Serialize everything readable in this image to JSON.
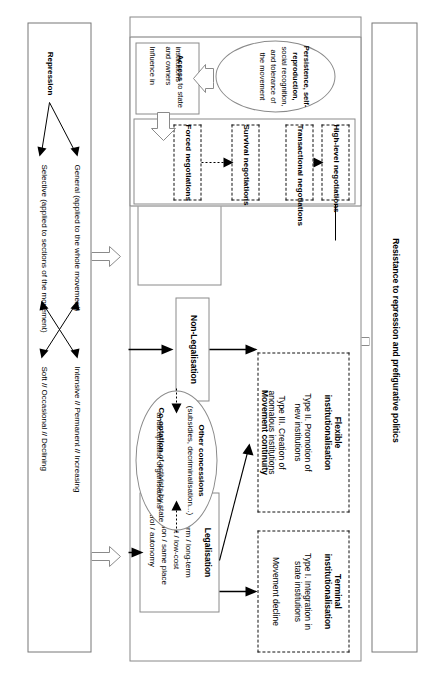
{
  "diagram": {
    "left_panel": {
      "name": "repression-panel",
      "root_label": "Repression",
      "branches": [
        {
          "label": "General (applied to the whole movement)",
          "intensity": "Intensive // Permanent // Increasing"
        },
        {
          "label": "Selective (applied to sections of the movement)",
          "intensity": "Soft // Occasional // Declining"
        }
      ]
    },
    "right_panel": {
      "name": "resistance-panel",
      "label": "Resistance to repression and prefigurative politics"
    },
    "center": {
      "outcomes": [
        {
          "name": "terminal-institutionalisation",
          "title": "Terminal\ninstitutionalisation",
          "lines": [
            "Type I. Integration in\nstate institutions",
            "Movement decline"
          ]
        },
        {
          "name": "flexible-institutionalisation",
          "title": "Flexible\ninstitutionalisation",
          "lines": [
            "Type II. Promotion of\nnew institutions",
            "Type III. Creation of\nanomalous institutions",
            "Movement continuity"
          ]
        }
      ],
      "legalisation": {
        "title": "Legalisation",
        "lines": [
          "Short-term / long-term",
          "High-cost / low-cost",
          "Relocation / same place",
          "Control / autonomy"
        ]
      },
      "non_legalisation": {
        "title": "Non-Legalisation"
      },
      "concessions_ellipse": {
        "line1_bold": "Other concessions",
        "line2": "(subsidies, decriminalisation...)",
        "line3_bold": "Co-optation",
        "line3_rest": " of activists by state",
        "line4": "and capitalist organisations"
      },
      "negotiations": [
        {
          "label": "High-level negotiations"
        },
        {
          "label": "Transactional negotiations"
        },
        {
          "label": "Survival negotiations"
        },
        {
          "label": "Forced negotiations"
        }
      ],
      "capacity_ellipse": {
        "line1": "Persistence, self-",
        "line2": "reproduction,",
        "line3": "social recognition,",
        "line4": "and tolerance of",
        "line5": "the movement"
      },
      "access_box": {
        "line1_bold": "Access",
        "line1_rest": " to state",
        "line2": "institutions",
        "line3": "and owners",
        "line4": "Influence in",
        "line5_bold": "agenda setting"
      }
    }
  }
}
